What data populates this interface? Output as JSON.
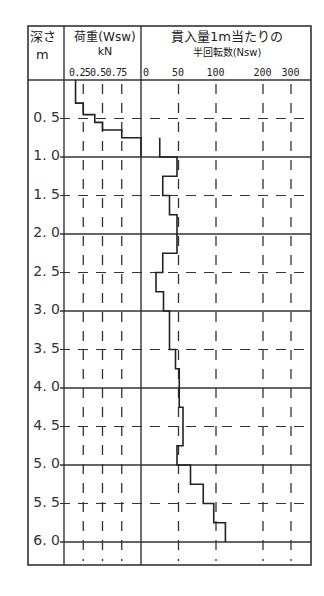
{
  "chart_data": {
    "type": "line",
    "title": "",
    "columns": {
      "depth": {
        "label_line1": "深さ",
        "label_line2": "m"
      },
      "wsw": {
        "label_line1": "荷重(Wsw)",
        "label_line2": "kN",
        "ticks": [
          "0.25",
          "0.5",
          "0.75"
        ],
        "tick_label_text": "0.250.50.75",
        "range": [
          0,
          1.0
        ]
      },
      "nsw": {
        "label_line1": "貫入量1m当たりの",
        "label_line2": "半回転数(Nsw)",
        "ticks": [
          "0",
          "50",
          "100",
          "200",
          "300"
        ]
      }
    },
    "depth_labels": [
      "0.5",
      "1.0",
      "1.5",
      "2.0",
      "2.5",
      "3.0",
      "3.5",
      "4.0",
      "4.5",
      "5.0",
      "5.5",
      "6.0"
    ],
    "depth_range": [
      0,
      6.6
    ],
    "ylabel": "深さ m",
    "wsw_profile": [
      {
        "from": 0.0,
        "to": 0.3,
        "value": 0.15
      },
      {
        "from": 0.3,
        "to": 0.45,
        "value": 0.25
      },
      {
        "from": 0.45,
        "to": 0.55,
        "value": 0.4
      },
      {
        "from": 0.55,
        "to": 0.65,
        "value": 0.5
      },
      {
        "from": 0.65,
        "to": 0.75,
        "value": 0.75
      },
      {
        "from": 0.75,
        "to": 1.0,
        "value": 1.0
      }
    ],
    "nsw_profile": [
      {
        "from": 0.75,
        "to": 1.0,
        "value": 25
      },
      {
        "from": 1.0,
        "to": 1.25,
        "value": 48
      },
      {
        "from": 1.25,
        "to": 1.5,
        "value": 29
      },
      {
        "from": 1.5,
        "to": 1.75,
        "value": 38
      },
      {
        "from": 1.75,
        "to": 2.25,
        "value": 48
      },
      {
        "from": 2.25,
        "to": 2.5,
        "value": 29
      },
      {
        "from": 2.5,
        "to": 2.75,
        "value": 20
      },
      {
        "from": 2.75,
        "to": 3.0,
        "value": 30
      },
      {
        "from": 3.0,
        "to": 3.5,
        "value": 38
      },
      {
        "from": 3.5,
        "to": 3.75,
        "value": 46
      },
      {
        "from": 3.75,
        "to": 4.25,
        "value": 51
      },
      {
        "from": 4.25,
        "to": 4.75,
        "value": 56
      },
      {
        "from": 4.75,
        "to": 5.0,
        "value": 48
      },
      {
        "from": 5.0,
        "to": 5.25,
        "value": 66
      },
      {
        "from": 5.25,
        "to": 5.5,
        "value": 83
      },
      {
        "from": 5.5,
        "to": 5.75,
        "value": 97
      },
      {
        "from": 5.75,
        "to": 6.0,
        "value": 120
      }
    ],
    "grid": true,
    "line_color": "#222222",
    "grid_color": "#333333"
  }
}
